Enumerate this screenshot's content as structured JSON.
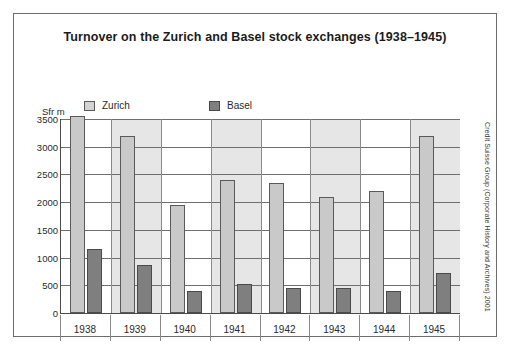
{
  "figure": {
    "title": "Turnover on the Zurich and Basel stock exchanges (1938–1945)",
    "credit": "Credit Suisse Group (Corporate History and Archives) 2001",
    "y_axis_unit": "Sfr m"
  },
  "legend": {
    "items": [
      {
        "label": "Zurich",
        "color": "#d3d3d3",
        "icon": "legend-swatch-icon"
      },
      {
        "label": "Basel",
        "color": "#7f7f7f",
        "icon": "legend-swatch-icon"
      }
    ]
  },
  "chart_data": {
    "type": "bar",
    "title": "Turnover on the Zurich and Basel stock exchanges (1938–1945)",
    "xlabel": "",
    "ylabel": "Sfr m",
    "ylim": [
      0,
      3500
    ],
    "ytick_step": 500,
    "yticks": [
      3500,
      3000,
      2500,
      2000,
      1500,
      1000,
      500,
      0
    ],
    "ytick_labels": [
      "3500",
      "3000",
      "2500",
      "2000",
      "1500",
      "1000",
      "500",
      "0"
    ],
    "grid": true,
    "legend_position": "top-left",
    "categories": [
      "1938",
      "1939",
      "1940",
      "1941",
      "1942",
      "1943",
      "1944",
      "1945"
    ],
    "series": [
      {
        "name": "Zurich",
        "color": "#c9c9c9",
        "values": [
          3550,
          3200,
          1950,
          2400,
          2340,
          2100,
          2200,
          3200
        ]
      },
      {
        "name": "Basel",
        "color": "#7f7f7f",
        "values": [
          1150,
          870,
          400,
          520,
          450,
          450,
          400,
          720
        ]
      }
    ],
    "band_shading": [
      false,
      true,
      false,
      true,
      false,
      true,
      false,
      true
    ]
  }
}
